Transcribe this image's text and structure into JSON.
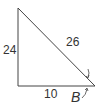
{
  "diagram": {
    "type": "right-triangle",
    "sides": {
      "vertical_leg": "24",
      "horizontal_leg": "10",
      "hypotenuse": "26"
    },
    "angle_label": "B",
    "stroke_color": "#444444",
    "text_color": "#333333"
  }
}
